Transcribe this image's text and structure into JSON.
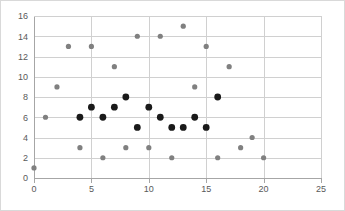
{
  "chart_data": {
    "type": "scatter",
    "title": "",
    "xlabel": "",
    "ylabel": "",
    "xlim": [
      0,
      25
    ],
    "ylim": [
      0,
      16
    ],
    "x_ticks": [
      0,
      5,
      10,
      15,
      20,
      25
    ],
    "y_ticks": [
      0,
      2,
      4,
      6,
      8,
      10,
      12,
      14,
      16
    ],
    "grid": "horizontal-and-vertical",
    "legend": "none",
    "series": [
      {
        "name": "series-gray",
        "color": "#808080",
        "marker": "circle",
        "points": [
          {
            "x": 0,
            "y": 1
          },
          {
            "x": 1,
            "y": 6
          },
          {
            "x": 2,
            "y": 9
          },
          {
            "x": 3,
            "y": 13
          },
          {
            "x": 4,
            "y": 3
          },
          {
            "x": 5,
            "y": 13
          },
          {
            "x": 6,
            "y": 2
          },
          {
            "x": 7,
            "y": 11
          },
          {
            "x": 8,
            "y": 3
          },
          {
            "x": 9,
            "y": 14
          },
          {
            "x": 10,
            "y": 3
          },
          {
            "x": 11,
            "y": 14
          },
          {
            "x": 12,
            "y": 2
          },
          {
            "x": 13,
            "y": 15
          },
          {
            "x": 14,
            "y": 9
          },
          {
            "x": 15,
            "y": 13
          },
          {
            "x": 16,
            "y": 2
          },
          {
            "x": 17,
            "y": 11
          },
          {
            "x": 18,
            "y": 3
          },
          {
            "x": 19,
            "y": 4
          },
          {
            "x": 20,
            "y": 2
          }
        ]
      },
      {
        "name": "series-black",
        "color": "#1a1a1a",
        "marker": "circle",
        "points": [
          {
            "x": 4,
            "y": 6
          },
          {
            "x": 5,
            "y": 7
          },
          {
            "x": 6,
            "y": 6
          },
          {
            "x": 7,
            "y": 7
          },
          {
            "x": 8,
            "y": 8
          },
          {
            "x": 9,
            "y": 5
          },
          {
            "x": 10,
            "y": 7
          },
          {
            "x": 11,
            "y": 6
          },
          {
            "x": 12,
            "y": 5
          },
          {
            "x": 13,
            "y": 5
          },
          {
            "x": 14,
            "y": 6
          },
          {
            "x": 15,
            "y": 5
          },
          {
            "x": 16,
            "y": 8
          }
        ]
      }
    ]
  },
  "style": {
    "grid_color": "#d0d0d0",
    "axis_color": "#a6a6a6",
    "tick_label_color": "#595959",
    "background": "#ffffff",
    "frame_border": "#d9d9d9"
  },
  "geometry": {
    "width": 345,
    "height": 211,
    "plot_left": 33,
    "plot_right": 320,
    "plot_top": 15,
    "plot_bottom": 177,
    "marker_radius_gray": 2.6,
    "marker_radius_black": 3.4
  }
}
